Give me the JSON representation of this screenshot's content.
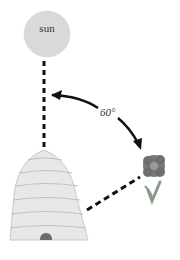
{
  "diagram": {
    "type": "bee-dance-orientation",
    "sun": {
      "label": "sun",
      "fill": "#d9d9d9"
    },
    "angle": {
      "label": "60°",
      "value_degrees": 60
    },
    "hive": {
      "fill": "#e6e6e6",
      "stripe": "#bdbdbd",
      "entrance": "#6b6b6b"
    },
    "flower": {
      "petal_fill": "#7a7a7a",
      "center_fill": "#9a9a9a",
      "stem": "#8a9a8a"
    },
    "line_color": "#111111"
  }
}
